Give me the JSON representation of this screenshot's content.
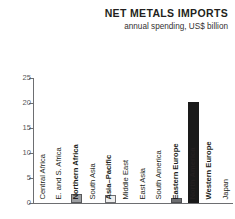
{
  "chart_data": {
    "type": "bar",
    "title": "NET METALS IMPORTS",
    "subtitle": "annual spending, US$ billion",
    "xlabel": "",
    "ylabel": "",
    "ylim": [
      0,
      25
    ],
    "yticks": [
      0,
      5,
      10,
      15,
      20,
      25
    ],
    "ytick_labels": [
      "0",
      "5",
      "10",
      "15",
      "20",
      "25"
    ],
    "grid": false,
    "legend": "none",
    "orientation": "vertical",
    "categories": [
      "Central Africa",
      "E. and S. Africa",
      "Northern Africa",
      "South Asia",
      "Asia–Pacific",
      "Middle East",
      "East Asia",
      "South America",
      "Eastern Europe",
      "North America",
      "Western Europe",
      "Japan"
    ],
    "values": [
      0,
      0,
      1.8,
      0,
      1.6,
      0,
      0,
      0,
      1.0,
      20.2,
      0,
      0
    ],
    "bar_styles": [
      "none",
      "none",
      "mid",
      "none",
      "light",
      "none",
      "none",
      "none",
      "darkgrey",
      "dark",
      "none",
      "none"
    ],
    "label_emphasis": [
      false,
      false,
      true,
      false,
      true,
      false,
      false,
      false,
      true,
      true,
      true,
      false
    ],
    "colors": {
      "bar_dark": "#1a1a1a",
      "bar_mid": "#9d9fa2",
      "bar_dark_grey": "#6d6e71",
      "bar_light": "#ededed",
      "axis": "#6d6e71",
      "text": "#231f20",
      "tick_text": "#58595b",
      "background": "#ffffff"
    }
  }
}
